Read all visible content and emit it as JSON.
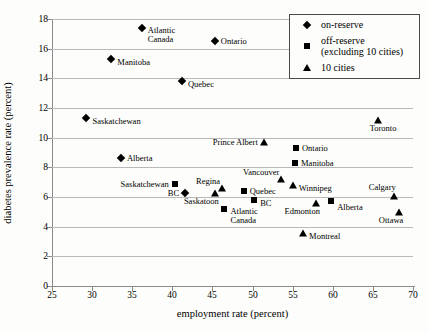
{
  "colors": {
    "marker": "#000000",
    "grid": "#b9b9b9",
    "axis": "#8a8a8a",
    "text": "#000000"
  },
  "legend": {
    "items": [
      {
        "marker": "diamond",
        "lines": [
          "on-reserve"
        ]
      },
      {
        "marker": "square",
        "lines": [
          "off-reserve",
          "(excluding 10 cities)"
        ]
      },
      {
        "marker": "triangle",
        "lines": [
          "10 cities"
        ]
      }
    ]
  },
  "chart_data": {
    "type": "scatter",
    "title": "",
    "xlabel": "employment rate (percent)",
    "ylabel": "diabetes prevalence rate (percent)",
    "xlim": [
      25,
      70
    ],
    "ylim": [
      0,
      18
    ],
    "x_ticks": [
      25,
      30,
      35,
      40,
      45,
      50,
      55,
      60,
      65,
      70
    ],
    "y_ticks": [
      0,
      2,
      4,
      6,
      8,
      10,
      12,
      14,
      16,
      18
    ],
    "grid": "horizontal",
    "legend_position": "top-right",
    "series": [
      {
        "name": "on-reserve",
        "marker": "diamond",
        "points": [
          {
            "label": "Atlantic Canada",
            "x": 36.2,
            "y": 17.4,
            "label_pos": "right-below",
            "label_lines": [
              "Atlantic",
              "Canada"
            ]
          },
          {
            "label": "Ontario",
            "x": 45.3,
            "y": 16.5,
            "label_pos": "right"
          },
          {
            "label": "Manitoba",
            "x": 32.4,
            "y": 15.3,
            "label_pos": "right-low"
          },
          {
            "label": "Quebec",
            "x": 41.2,
            "y": 13.8,
            "label_pos": "right-low"
          },
          {
            "label": "Saskatchewan",
            "x": 29.3,
            "y": 11.3,
            "label_pos": "right-low"
          },
          {
            "label": "Alberta",
            "x": 33.6,
            "y": 8.6,
            "label_pos": "right"
          },
          {
            "label": "BC",
            "x": 41.6,
            "y": 6.3,
            "label_pos": "left"
          }
        ]
      },
      {
        "name": "off-reserve (excluding 10 cities)",
        "marker": "square",
        "points": [
          {
            "label": "Ontario",
            "x": 55.4,
            "y": 9.3,
            "label_pos": "right"
          },
          {
            "label": "Manitoba",
            "x": 55.3,
            "y": 8.3,
            "label_pos": "right"
          },
          {
            "label": "Saskatchewan",
            "x": 40.3,
            "y": 6.9,
            "label_pos": "left"
          },
          {
            "label": "Quebec",
            "x": 48.9,
            "y": 6.4,
            "label_pos": "right"
          },
          {
            "label": "BC",
            "x": 50.2,
            "y": 5.8,
            "label_pos": "right-low"
          },
          {
            "label": "Alberta",
            "x": 59.8,
            "y": 5.7,
            "label_pos": "right-below"
          },
          {
            "label": "Atlantic Canada",
            "x": 46.5,
            "y": 5.2,
            "label_pos": "right-below",
            "label_lines": [
              "Atlantic",
              "Canada"
            ]
          }
        ]
      },
      {
        "name": "10 cities",
        "marker": "triangle",
        "points": [
          {
            "label": "Toronto",
            "x": 65.6,
            "y": 11.2,
            "label_pos": "below"
          },
          {
            "label": "Prince Albert",
            "x": 51.4,
            "y": 9.7,
            "label_pos": "left"
          },
          {
            "label": "Vancouver",
            "x": 53.6,
            "y": 7.2,
            "label_pos": "left-high"
          },
          {
            "label": "Winnipeg",
            "x": 55.0,
            "y": 6.8,
            "label_pos": "right-low"
          },
          {
            "label": "Regina",
            "x": 46.2,
            "y": 6.6,
            "label_pos": "left-high"
          },
          {
            "label": "Saskatoon",
            "x": 45.3,
            "y": 6.3,
            "label_pos": "below-left"
          },
          {
            "label": "Calgary",
            "x": 67.6,
            "y": 6.1,
            "label_pos": "above-left"
          },
          {
            "label": "Edmonton",
            "x": 57.9,
            "y": 5.6,
            "label_pos": "below-left"
          },
          {
            "label": "Ottawa",
            "x": 68.3,
            "y": 5.0,
            "label_pos": "below-left"
          },
          {
            "label": "Montreal",
            "x": 56.3,
            "y": 3.6,
            "label_pos": "right-low"
          }
        ]
      }
    ]
  }
}
